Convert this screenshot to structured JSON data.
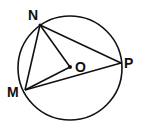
{
  "diagram": {
    "type": "circle-geometry",
    "stroke_color": "#111111",
    "background": "#ffffff",
    "circle": {
      "center_label": "O",
      "cx": 70,
      "cy": 68,
      "r": 52
    },
    "points": {
      "N": {
        "label": "N",
        "x": 40,
        "y": 25
      },
      "P": {
        "label": "P",
        "x": 121,
        "y": 63
      },
      "M": {
        "label": "M",
        "x": 25,
        "y": 90
      },
      "O": {
        "label": "O",
        "x": 70,
        "y": 67
      }
    },
    "segments": [
      "NP",
      "NM",
      "NO",
      "MO",
      "MP"
    ]
  }
}
